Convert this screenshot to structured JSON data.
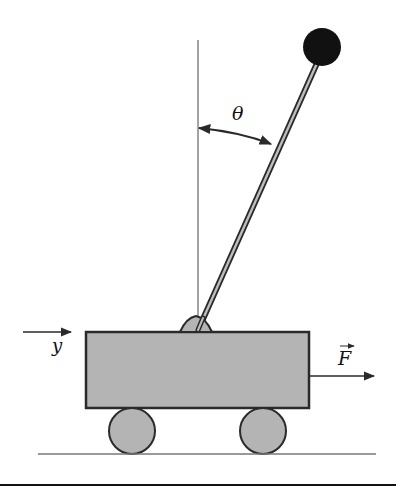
{
  "diagram": {
    "labels": {
      "angle": "θ",
      "position": "y",
      "force": "F"
    },
    "colors": {
      "cart_fill": "#b4b4b4",
      "outline": "#2a2a2a",
      "bob": "#111111",
      "line": "#555555",
      "background": "#ffffff"
    },
    "elements": [
      "vertical-reference-line",
      "pendulum-rod",
      "pendulum-bob",
      "angle-arc-arrow",
      "cart-body",
      "pivot-mount",
      "front-wheel",
      "rear-wheel",
      "ground-line",
      "position-arrow",
      "force-arrow"
    ]
  }
}
